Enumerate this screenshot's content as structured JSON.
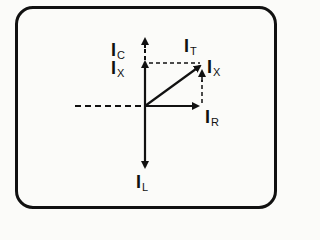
{
  "diagram": {
    "labels": {
      "ic": {
        "main": "I",
        "sub": "C"
      },
      "ix_left": {
        "main": "I",
        "sub": "X"
      },
      "it": {
        "main": "I",
        "sub": "T"
      },
      "ix_right": {
        "main": "I",
        "sub": "X"
      },
      "ir": {
        "main": "I",
        "sub": "R"
      },
      "il": {
        "main": "I",
        "sub": "L"
      }
    },
    "colors": {
      "stroke": "#111111",
      "background": "#fbfbf9"
    }
  }
}
